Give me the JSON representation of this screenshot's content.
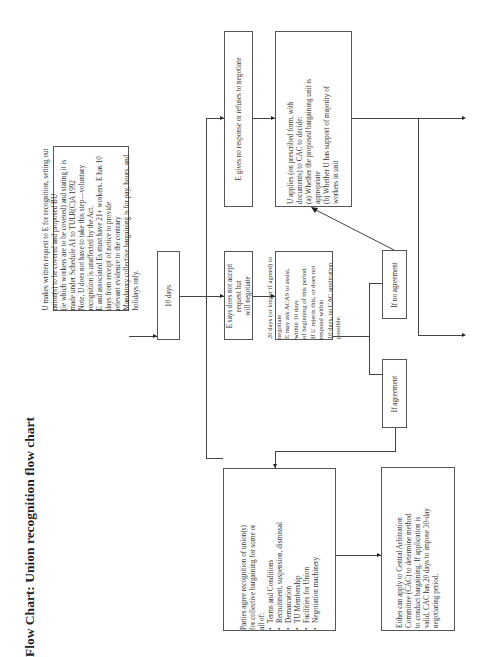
{
  "title": "Flow Chart: Union recognition flow chart",
  "boxes": {
    "request": {
      "lines": [
        "U makes written request to E for recognition, setting out union(s) to be covered and proposed BU",
        "(ie which workers are to be covered) and stating it is made under Schedule A1 to TULR(C)A 1992",
        "Note, U does not have to take this step—voluntary recognition is unaffected by the Act.",
        "E and associated Es must have 21+ workers. E has 10 days from receipt of notice to provide",
        "relevant evidence to the contrary",
        "Mandatory collective bargaining is for pay, hours, and holidays only."
      ]
    },
    "ten_days": {
      "text": "10 days"
    },
    "no_response": {
      "text": "E gives no response or refuses to negotiate"
    },
    "will_negotiate": {
      "lines": [
        "E says does not accept request but",
        "will negotiate"
      ]
    },
    "twenty_days": {
      "lines": [
        "20 days (or longer if agreed) to negotiate.",
        "E may ask ACAS to assist, within 10 days",
        "of beginning of this period.",
        "If U rejects this, or does not respond within",
        "10 days, no CAC application possible."
      ]
    },
    "applies": {
      "lines": [
        "U applies (on prescribed form, with",
        "documents) to CAC to decide:",
        "(a) Whether the proposed bargaining unit is",
        "appropriate",
        "(b) Whether U has support of majority of",
        "workers in unit"
      ]
    },
    "if_no_agreement": {
      "text": "If no agreement"
    },
    "if_agreement": {
      "text": "If agreement"
    },
    "parties_agree": {
      "intro": [
        "Parties agree recognition of union(s)",
        "for collective bargaining for some or",
        "all of:"
      ],
      "items": [
        "Terms and Conditions",
        "Recruitment, suspension, dismissal",
        "Demarcation",
        "TU Membership",
        "Facilities for Union",
        "Negotiation machinery"
      ]
    },
    "cac": {
      "lines": [
        "Either can apply to Central Arbitration",
        "Committee (CAC) to determine method",
        "to conduct bargaining. If application is",
        "valid, CAC has 20 days to impose 30-day",
        "negotiating period."
      ]
    }
  }
}
